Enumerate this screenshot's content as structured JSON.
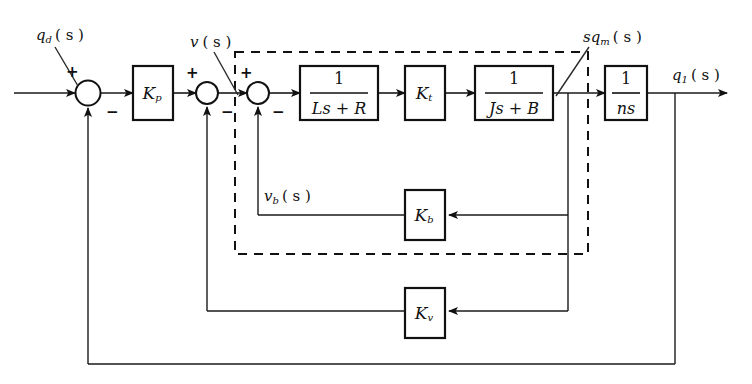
{
  "diagram": {
    "type": "control-system-block-diagram",
    "colors": {
      "line": "#111111",
      "background": "#ffffff",
      "dashed_enclosure": "#111111"
    },
    "signals": {
      "input": "q_d (s)",
      "input_base": "q",
      "input_sub": "d",
      "input_arg": "( s )",
      "velocity_cmd": "v (s)",
      "velocity_cmd_base": "v",
      "velocity_cmd_sub": "",
      "velocity_cmd_arg": "( s )",
      "motor_rate": "sq_m (s)",
      "motor_rate_base": "sq",
      "motor_rate_sub": "m",
      "motor_rate_arg": "( s )",
      "back_emf": "v_b (s)",
      "back_emf_base": "v",
      "back_emf_sub": "b",
      "back_emf_arg": "( s )",
      "output": "q_1 (s)",
      "output_base": "q",
      "output_sub": "1",
      "output_arg": "( s )"
    },
    "blocks": [
      {
        "id": "kp",
        "name": "proportional-gain-block",
        "label": "K",
        "subscript": "p",
        "kind": "gain",
        "x": 133,
        "y": 66,
        "w": 40,
        "h": 54
      },
      {
        "id": "electrical",
        "name": "electrical-dynamics-block",
        "numerator": "1",
        "denominator": "Ls + R",
        "kind": "transfer-function",
        "x": 300,
        "y": 66,
        "w": 78,
        "h": 54
      },
      {
        "id": "kt",
        "name": "torque-constant-block",
        "label": "K",
        "subscript": "t",
        "kind": "gain",
        "x": 405,
        "y": 66,
        "w": 40,
        "h": 54
      },
      {
        "id": "mechanical",
        "name": "mechanical-dynamics-block",
        "numerator": "1",
        "denominator": "Js + B",
        "kind": "transfer-function",
        "x": 475,
        "y": 66,
        "w": 78,
        "h": 54
      },
      {
        "id": "gear",
        "name": "gear-ratio-integrator-block",
        "numerator": "1",
        "denominator": "ns",
        "kind": "transfer-function",
        "x": 605,
        "y": 66,
        "w": 42,
        "h": 54
      },
      {
        "id": "kb",
        "name": "back-emf-constant-block",
        "label": "K",
        "subscript": "b",
        "kind": "gain",
        "x": 405,
        "y": 190,
        "w": 40,
        "h": 50
      },
      {
        "id": "kv",
        "name": "velocity-feedback-gain-block",
        "label": "K",
        "subscript": "v",
        "kind": "gain",
        "x": 405,
        "y": 288,
        "w": 40,
        "h": 50
      }
    ],
    "summing_junctions": [
      {
        "id": "sum1",
        "name": "position-error-summing-junction",
        "cx": 88,
        "cy": 93,
        "r": 12,
        "plus": "+",
        "minus": "−"
      },
      {
        "id": "sum2",
        "name": "velocity-error-summing-junction",
        "cx": 207,
        "cy": 93,
        "r": 11,
        "plus": "+",
        "minus": "−"
      },
      {
        "id": "sum3",
        "name": "back-emf-summing-junction",
        "cx": 258,
        "cy": 93,
        "r": 11,
        "plus": "+",
        "minus": "−"
      }
    ],
    "enclosure": {
      "name": "motor-subsystem-dashed-enclosure",
      "x": 235,
      "y": 52,
      "w": 353,
      "h": 202
    },
    "feedback_paths": [
      {
        "name": "back-emf-feedback-path",
        "gain": "K_b",
        "from": "motor-rate-tap",
        "to": "sum3"
      },
      {
        "name": "velocity-feedback-path",
        "gain": "K_v",
        "from": "motor-rate-tap",
        "to": "sum2"
      },
      {
        "name": "position-feedback-path",
        "gain": "unity",
        "from": "output-tap",
        "to": "sum1"
      }
    ]
  }
}
